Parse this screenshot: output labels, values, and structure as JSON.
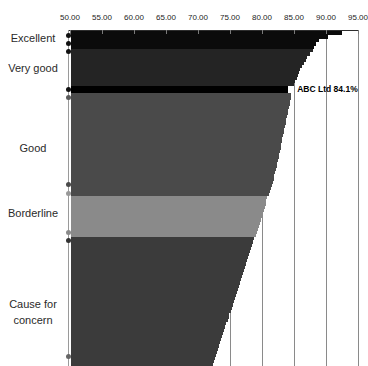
{
  "chart_data": {
    "type": "bar",
    "orientation": "horizontal",
    "title": "",
    "xlabel": "",
    "ylabel": "",
    "x_axis": {
      "position": "top",
      "min": 50,
      "max": 95,
      "tick_step": 5,
      "tick_labels": [
        "50.00",
        "55.00",
        "60.00",
        "65.00",
        "70.00",
        "75.00",
        "80.00",
        "85.00",
        "90.00",
        "95.00"
      ],
      "tick_values": [
        50,
        55,
        60,
        65,
        70,
        75,
        80,
        85,
        90,
        95
      ]
    },
    "gridlines_at_values": [
      75,
      80,
      85,
      90,
      95
    ],
    "legend_position": "none",
    "bands": [
      {
        "label": "Excellent",
        "color": "#0b0b0b",
        "row_px": 3.6,
        "values": [
          92.5,
          90.3,
          88.9,
          88.4,
          88.1
        ]
      },
      {
        "label": "Very good",
        "color": "#242424",
        "row_px": 3.08,
        "values": [
          87.9,
          87.5,
          87.1,
          86.8,
          86.5,
          86.25,
          86.0,
          85.8,
          85.6,
          85.4,
          85.2,
          85.05
        ]
      },
      {
        "label": "ABC Ltd",
        "color": "#000000",
        "row_px": 7,
        "highlight": true,
        "values": [
          84.1
        ]
      },
      {
        "label": "Good",
        "color": "#4a4a4a",
        "row_px": 3.12,
        "values": [
          84.6,
          84.5,
          84.4,
          84.3,
          84.2,
          84.1,
          84.0,
          83.9,
          83.8,
          83.7,
          83.6,
          83.5,
          83.4,
          83.3,
          83.2,
          83.1,
          83.0,
          82.9,
          82.8,
          82.7,
          82.6,
          82.5,
          82.4,
          82.3,
          82.2,
          82.1,
          81.95,
          81.8,
          81.65,
          81.5,
          81.35,
          81.2,
          81.05
        ]
      },
      {
        "label": "Borderline",
        "color": "#8a8a8a",
        "row_px": 3.15,
        "values": [
          80.85,
          80.7,
          80.55,
          80.4,
          80.25,
          80.1,
          79.95,
          79.8,
          79.65,
          79.5,
          79.35,
          79.2,
          79.05
        ]
      },
      {
        "label": "Cause for concern",
        "color": "#3b3b3b",
        "row_px": 3.15,
        "values": [
          78.7,
          78.54,
          78.39,
          78.23,
          78.07,
          77.91,
          77.76,
          77.6,
          77.44,
          77.29,
          77.13,
          76.97,
          76.81,
          76.66,
          76.5,
          76.34,
          76.18,
          76.03,
          75.87,
          75.71,
          75.55,
          75.4,
          75.24,
          75.08,
          74.92,
          74.77,
          74.61,
          74.45,
          74.29,
          74.14,
          73.98,
          73.82,
          73.66,
          73.51,
          73.35,
          73.19,
          73.03,
          72.88,
          72.72,
          72.56,
          72.4
        ]
      }
    ],
    "side_labels": [
      {
        "text": "Excellent",
        "y_px": 38
      },
      {
        "text": "Very good",
        "y_px": 68
      },
      {
        "text": "Good",
        "y_px": 148
      },
      {
        "text": "Borderline",
        "y_px": 213
      },
      {
        "text": "Cause for concern",
        "y_px": 304
      }
    ],
    "axis_markers": [
      {
        "y_px": 35,
        "color": "#111111"
      },
      {
        "y_px": 43,
        "color": "#111111"
      },
      {
        "y_px": 51,
        "color": "#111111"
      },
      {
        "y_px": 89,
        "color": "#111111"
      },
      {
        "y_px": 97,
        "color": "#5a5a5a"
      },
      {
        "y_px": 184,
        "color": "#4a4a4a"
      },
      {
        "y_px": 193,
        "color": "#999999"
      },
      {
        "y_px": 232,
        "color": "#8a8a8a"
      },
      {
        "y_px": 240,
        "color": "#333333"
      },
      {
        "y_px": 356,
        "color": "#666666"
      }
    ],
    "annotation": {
      "text": "ABC Ltd 84.1%",
      "value": 84.1
    },
    "colors": {
      "grid": "#8a8a8a",
      "top_axis": "#2e2e2e",
      "left_axis": "#9a9a9a",
      "tick": "#7a7a7a",
      "tick_label": "#1d1d1d",
      "side_label": "#2a2a2a"
    }
  }
}
